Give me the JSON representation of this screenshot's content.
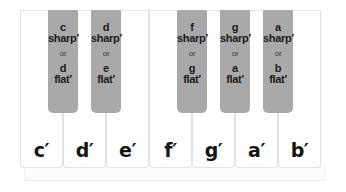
{
  "diagram": {
    "title": "",
    "colors": {
      "white_key": "#ffffff",
      "black_key": "#a9a9a9",
      "text": "#151515"
    },
    "white_keys": [
      {
        "label": "c′"
      },
      {
        "label": "d′"
      },
      {
        "label": "e′"
      },
      {
        "label": "f′"
      },
      {
        "label": "g′"
      },
      {
        "label": "a′"
      },
      {
        "label": "b′"
      }
    ],
    "black_keys": [
      {
        "note1": "c",
        "acc1": "sharp′",
        "or": "or",
        "note2": "d",
        "acc2": "flat′"
      },
      {
        "note1": "d",
        "acc1": "sharp′",
        "or": "or",
        "note2": "e",
        "acc2": "flat′"
      },
      {
        "note1": "f",
        "acc1": "sharp′",
        "or": "or",
        "note2": "g",
        "acc2": "flat′"
      },
      {
        "note1": "g",
        "acc1": "sharp′",
        "or": "or",
        "note2": "a",
        "acc2": "flat′"
      },
      {
        "note1": "a",
        "acc1": "sharp′",
        "or": "or",
        "note2": "b",
        "acc2": "flat′"
      }
    ]
  }
}
